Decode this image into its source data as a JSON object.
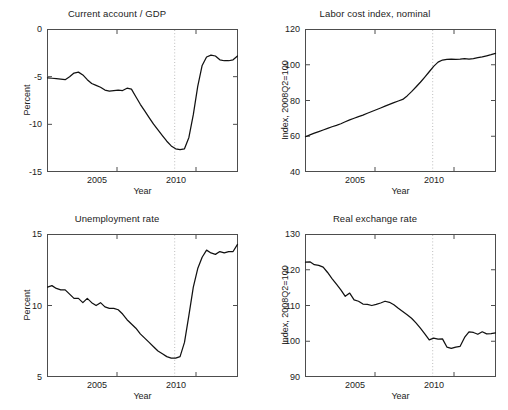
{
  "figure": {
    "background": "#ffffff",
    "line_color": "#111111",
    "axis_color": "#4d4d4d",
    "marker_line_color": "#bdbdbd",
    "panel_count": 4
  },
  "chart_data": [
    {
      "type": "line",
      "panel": "top-left",
      "title": "Current account / GDP",
      "xlabel": "Year",
      "ylabel": "Percent",
      "xlim": [
        2001.0,
        2011.75
      ],
      "ylim": [
        -15,
        0
      ],
      "xticks": [
        2005,
        2010
      ],
      "xticklabels": [
        "2005",
        "2010"
      ],
      "yticks": [
        -15,
        -10,
        -5,
        0
      ],
      "yticklabels": [
        "-15",
        "-10",
        "-5",
        "0"
      ],
      "grid": false,
      "legend": null,
      "annotations": [
        {
          "type": "vertical-dotted-line",
          "x": 2008.2,
          "label": "2008Q2"
        }
      ],
      "series": [
        {
          "name": "Current account / GDP",
          "x": [
            2001.0,
            2001.25,
            2001.5,
            2001.75,
            2002.0,
            2002.25,
            2002.5,
            2002.75,
            2003.0,
            2003.25,
            2003.5,
            2003.75,
            2004.0,
            2004.25,
            2004.5,
            2004.75,
            2005.0,
            2005.25,
            2005.5,
            2005.75,
            2006.0,
            2006.25,
            2006.5,
            2006.75,
            2007.0,
            2007.25,
            2007.5,
            2007.75,
            2008.0,
            2008.25,
            2008.5,
            2008.75,
            2009.0,
            2009.25,
            2009.5,
            2009.75,
            2010.0,
            2010.25,
            2010.5,
            2010.75,
            2011.0,
            2011.25,
            2011.5,
            2011.75
          ],
          "y": [
            -5.1,
            -5.15,
            -5.2,
            -5.25,
            -5.3,
            -5.0,
            -4.6,
            -4.5,
            -4.8,
            -5.3,
            -5.7,
            -5.9,
            -6.1,
            -6.4,
            -6.5,
            -6.45,
            -6.4,
            -6.45,
            -6.2,
            -6.3,
            -7.1,
            -7.9,
            -8.6,
            -9.3,
            -10.0,
            -10.6,
            -11.2,
            -11.8,
            -12.3,
            -12.6,
            -12.7,
            -12.6,
            -11.4,
            -9.0,
            -6.0,
            -3.8,
            -2.9,
            -2.7,
            -2.8,
            -3.2,
            -3.3,
            -3.3,
            -3.2,
            -2.8
          ]
        }
      ]
    },
    {
      "type": "line",
      "panel": "top-right",
      "title": "Labor cost index, nominal",
      "xlabel": "Year",
      "ylabel": "Index, 2008Q2=100",
      "xlim": [
        2001.0,
        2011.75
      ],
      "ylim": [
        40,
        120
      ],
      "xticks": [
        2005,
        2010
      ],
      "xticklabels": [
        "2005",
        "2010"
      ],
      "yticks": [
        40,
        60,
        80,
        100,
        120
      ],
      "yticklabels": [
        "40",
        "60",
        "80",
        "100",
        "120"
      ],
      "grid": false,
      "legend": null,
      "annotations": [
        {
          "type": "vertical-dotted-line",
          "x": 2008.2,
          "label": "2008Q2"
        }
      ],
      "series": [
        {
          "name": "Labor cost index, nominal",
          "x": [
            2001.0,
            2001.25,
            2001.5,
            2001.75,
            2002.0,
            2002.25,
            2002.5,
            2002.75,
            2003.0,
            2003.25,
            2003.5,
            2003.75,
            2004.0,
            2004.25,
            2004.5,
            2004.75,
            2005.0,
            2005.25,
            2005.5,
            2005.75,
            2006.0,
            2006.25,
            2006.5,
            2006.75,
            2007.0,
            2007.25,
            2007.5,
            2007.75,
            2008.0,
            2008.25,
            2008.5,
            2008.75,
            2009.0,
            2009.25,
            2009.5,
            2009.75,
            2010.0,
            2010.25,
            2010.5,
            2010.75,
            2011.0,
            2011.25,
            2011.5,
            2011.75
          ],
          "y": [
            59.6,
            60.6,
            61.6,
            62.5,
            63.4,
            64.3,
            65.2,
            66.0,
            66.9,
            68.0,
            69.1,
            70.0,
            70.9,
            71.8,
            72.8,
            73.8,
            74.8,
            75.8,
            76.8,
            77.8,
            78.8,
            79.7,
            80.6,
            82.6,
            85.0,
            87.6,
            90.3,
            93.2,
            96.2,
            99.2,
            101.6,
            102.8,
            103.2,
            103.3,
            103.2,
            103.3,
            103.6,
            103.3,
            103.6,
            104.1,
            104.6,
            105.2,
            105.8,
            106.5
          ]
        }
      ]
    },
    {
      "type": "line",
      "panel": "bottom-left",
      "title": "Unemployment rate",
      "xlabel": "Year",
      "ylabel": "Percent",
      "xlim": [
        2001.0,
        2011.75
      ],
      "ylim": [
        5,
        15
      ],
      "xticks": [
        2005,
        2010
      ],
      "xticklabels": [
        "2005",
        "2010"
      ],
      "yticks": [
        5,
        10,
        15
      ],
      "yticklabels": [
        "5",
        "10",
        "15"
      ],
      "grid": false,
      "legend": null,
      "annotations": [
        {
          "type": "vertical-dotted-line",
          "x": 2008.2,
          "label": "2008Q2"
        }
      ],
      "series": [
        {
          "name": "Unemployment rate",
          "x": [
            2001.0,
            2001.25,
            2001.5,
            2001.75,
            2002.0,
            2002.25,
            2002.5,
            2002.75,
            2003.0,
            2003.25,
            2003.5,
            2003.75,
            2004.0,
            2004.25,
            2004.5,
            2004.75,
            2005.0,
            2005.25,
            2005.5,
            2005.75,
            2006.0,
            2006.25,
            2006.5,
            2006.75,
            2007.0,
            2007.25,
            2007.5,
            2007.75,
            2008.0,
            2008.25,
            2008.5,
            2008.75,
            2009.0,
            2009.25,
            2009.5,
            2009.75,
            2010.0,
            2010.25,
            2010.5,
            2010.75,
            2011.0,
            2011.25,
            2011.5,
            2011.75
          ],
          "y": [
            11.3,
            11.4,
            11.2,
            11.1,
            11.1,
            10.8,
            10.5,
            10.5,
            10.2,
            10.5,
            10.2,
            10.0,
            10.2,
            9.9,
            9.8,
            9.8,
            9.7,
            9.4,
            9.0,
            8.7,
            8.4,
            8.0,
            7.7,
            7.4,
            7.1,
            6.8,
            6.6,
            6.4,
            6.3,
            6.3,
            6.4,
            7.4,
            9.3,
            11.3,
            12.6,
            13.4,
            13.9,
            13.7,
            13.6,
            13.8,
            13.7,
            13.8,
            13.8,
            14.3
          ]
        }
      ]
    },
    {
      "type": "line",
      "panel": "bottom-right",
      "title": "Real exchange rate",
      "xlabel": "Year",
      "ylabel": "Index, 2008Q2=100",
      "xlim": [
        2001.0,
        2011.75
      ],
      "ylim": [
        90,
        130
      ],
      "xticks": [
        2005,
        2010
      ],
      "xticklabels": [
        "2005",
        "2010"
      ],
      "yticks": [
        90,
        100,
        110,
        120,
        130
      ],
      "yticklabels": [
        "90",
        "100",
        "110",
        "120",
        "130"
      ],
      "grid": false,
      "legend": null,
      "annotations": [
        {
          "type": "vertical-dotted-line",
          "x": 2008.2,
          "label": "2008Q2"
        }
      ],
      "series": [
        {
          "name": "Real exchange rate",
          "x": [
            2001.0,
            2001.25,
            2001.5,
            2001.75,
            2002.0,
            2002.25,
            2002.5,
            2002.75,
            2003.0,
            2003.25,
            2003.5,
            2003.75,
            2004.0,
            2004.25,
            2004.5,
            2004.75,
            2005.0,
            2005.25,
            2005.5,
            2005.75,
            2006.0,
            2006.25,
            2006.5,
            2006.75,
            2007.0,
            2007.25,
            2007.5,
            2007.75,
            2008.0,
            2008.25,
            2008.5,
            2008.75,
            2009.0,
            2009.25,
            2009.5,
            2009.75,
            2010.0,
            2010.25,
            2010.5,
            2010.75,
            2011.0,
            2011.25,
            2011.5,
            2011.75
          ],
          "y": [
            122.2,
            122.3,
            121.5,
            121.3,
            120.8,
            119.3,
            117.6,
            116.0,
            114.4,
            112.6,
            113.5,
            111.6,
            111.2,
            110.4,
            110.3,
            110.0,
            110.3,
            110.7,
            111.2,
            110.9,
            110.2,
            109.2,
            108.3,
            107.4,
            106.4,
            105.1,
            103.6,
            102.0,
            100.3,
            100.8,
            100.5,
            100.6,
            98.3,
            97.9,
            98.3,
            98.5,
            101.0,
            102.6,
            102.4,
            101.9,
            102.6,
            102.0,
            102.1,
            102.3
          ]
        }
      ]
    }
  ]
}
